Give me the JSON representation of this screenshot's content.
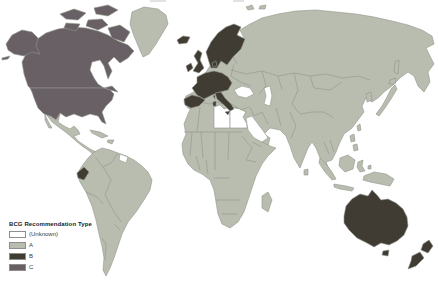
{
  "figure": {
    "legend": {
      "title": "BCG Recommendation Type",
      "items": [
        {
          "label": "(Unknown)",
          "color": "#ffffff"
        },
        {
          "label": "A",
          "color": "#b8bdb0"
        },
        {
          "label": "B",
          "color": "#403c33"
        },
        {
          "label": "C",
          "color": "#696065"
        }
      ]
    },
    "colors": {
      "ocean": "#ffffff",
      "unknown": "#ffffff",
      "A": "#b8bdb0",
      "B": "#403c33",
      "C": "#696065",
      "border": "#90958a"
    },
    "regions": {
      "A_countries": "Greenland, Mexico, Caribbean, South America (most), Africa (most), Eastern Europe, Russia, Middle East (most), Asia, Indonesia, Japan, Papua New Guinea",
      "B_countries": "Iceland, United Kingdom, Ireland, Scandinavia, Western/Central Europe, Iberia, Italy, Ecuador, Australia, New Zealand",
      "C_countries": "Canada, United States, Alaska, Canadian Arctic islands",
      "unknown_countries": "Libya, Egypt, Saudi Arabia, Guyana"
    }
  }
}
